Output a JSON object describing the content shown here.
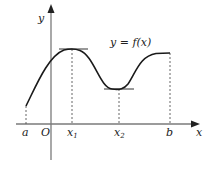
{
  "diagram": {
    "type": "function-graph",
    "curve_label": "y = f(x)",
    "axes": {
      "x_label": "x",
      "y_label": "y",
      "origin_label": "O"
    },
    "x_ticks": [
      {
        "label": "a",
        "sub": ""
      },
      {
        "label": "O",
        "sub": ""
      },
      {
        "label": "x",
        "sub": "1"
      },
      {
        "label": "x",
        "sub": "2"
      },
      {
        "label": "b",
        "sub": ""
      }
    ],
    "features": [
      {
        "name": "local maximum at x1",
        "tangent": "horizontal"
      },
      {
        "name": "local minimum at x2",
        "tangent": "horizontal"
      },
      {
        "name": "endpoint at b"
      }
    ],
    "colors": {
      "curve": "#1a1a1a",
      "axis": "#7a7a7a"
    }
  }
}
